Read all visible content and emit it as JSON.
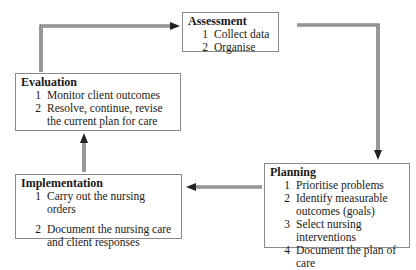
{
  "diagram": {
    "type": "cycle",
    "stages": {
      "assessment": {
        "title": "Assessment",
        "items": [
          {
            "num": "1",
            "text": "Collect data"
          },
          {
            "num": "2",
            "text": "Organise"
          }
        ]
      },
      "planning": {
        "title": "Planning",
        "items": [
          {
            "num": "1",
            "text": "Prioritise problems"
          },
          {
            "num": "2",
            "text": "Identify measurable outcomes (goals)"
          },
          {
            "num": "3",
            "text": "Select nursing interventions"
          },
          {
            "num": "4",
            "text": "Document the plan of care"
          }
        ]
      },
      "implementation": {
        "title": "Implementation",
        "items": [
          {
            "num": "1",
            "text": "Carry out the nursing orders"
          },
          {
            "num": "2",
            "text": "Document the nursing care and client responses"
          }
        ]
      },
      "evaluation": {
        "title": "Evaluation",
        "items": [
          {
            "num": "1",
            "text": "Monitor client outcomes"
          },
          {
            "num": "2",
            "text": "Resolve, continue, revise the current plan for care"
          }
        ]
      }
    },
    "flow": [
      {
        "from": "evaluation",
        "to": "assessment"
      },
      {
        "from": "assessment",
        "to": "planning"
      },
      {
        "from": "planning",
        "to": "implementation"
      },
      {
        "from": "implementation",
        "to": "evaluation"
      }
    ],
    "colors": {
      "box_border": "#8a8a8a",
      "arrow": "#555555",
      "arrow_inner": "#d0d0d0",
      "text": "#1a1a1a"
    }
  }
}
